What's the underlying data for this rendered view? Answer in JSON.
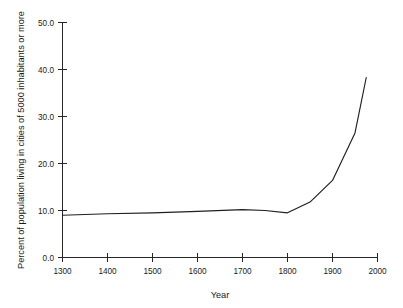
{
  "chart_data": {
    "type": "line",
    "title": "",
    "xlabel": "Year",
    "ylabel": "Percent of population living in cities of 5000 inhabitants or more",
    "xlim": [
      1300,
      2000
    ],
    "ylim": [
      0.0,
      50.0
    ],
    "grid": false,
    "legend": "none",
    "xticks": [
      1300,
      1400,
      1500,
      1600,
      1700,
      1800,
      1900,
      2000
    ],
    "xticklabels": [
      "1300",
      "1400",
      "1500",
      "1600",
      "1700",
      "1800",
      "1900",
      "2000"
    ],
    "yticks": [
      0.0,
      10.0,
      20.0,
      30.0,
      40.0,
      50.0
    ],
    "yticklabels": [
      "0.0",
      "10.0",
      "20.0",
      "30.0",
      "40.0",
      "50.0"
    ],
    "series": [
      {
        "name": "urban-population-percent",
        "x": [
          1300,
          1400,
          1500,
          1600,
          1700,
          1750,
          1800,
          1850,
          1900,
          1950,
          1975
        ],
        "values": [
          9.0,
          9.3,
          9.5,
          9.8,
          10.2,
          10.0,
          9.5,
          11.8,
          16.4,
          26.5,
          38.3
        ]
      }
    ]
  },
  "axes": {
    "x_title": "Year",
    "y_title": "Percent of population living in cities of 5000 inhabitants or more"
  }
}
